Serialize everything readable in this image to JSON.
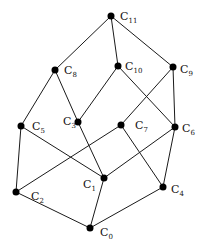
{
  "nodes": [
    {
      "id": "C0",
      "base": "C",
      "sub": "0",
      "x": 90,
      "y": 228,
      "lx": 100,
      "ly": 236
    },
    {
      "id": "C1",
      "base": "C",
      "sub": "1",
      "x": 104,
      "y": 178,
      "lx": 83,
      "ly": 188
    },
    {
      "id": "C2",
      "base": "C",
      "sub": "2",
      "x": 16,
      "y": 192,
      "lx": 31,
      "ly": 200
    },
    {
      "id": "C3",
      "base": "C",
      "sub": "3",
      "x": 78,
      "y": 122,
      "lx": 63,
      "ly": 125
    },
    {
      "id": "C4",
      "base": "C",
      "sub": "4",
      "x": 163,
      "y": 187,
      "lx": 171,
      "ly": 193
    },
    {
      "id": "C5",
      "base": "C",
      "sub": "5",
      "x": 21,
      "y": 126,
      "lx": 32,
      "ly": 130
    },
    {
      "id": "C6",
      "base": "C",
      "sub": "6",
      "x": 175,
      "y": 127,
      "lx": 182,
      "ly": 132
    },
    {
      "id": "C7",
      "base": "C",
      "sub": "7",
      "x": 121,
      "y": 125,
      "lx": 135,
      "ly": 129
    },
    {
      "id": "C8",
      "base": "C",
      "sub": "8",
      "x": 55,
      "y": 70,
      "lx": 64,
      "ly": 74
    },
    {
      "id": "C9",
      "base": "C",
      "sub": "9",
      "x": 173,
      "y": 67,
      "lx": 180,
      "ly": 73
    },
    {
      "id": "C10",
      "base": "C",
      "sub": "10",
      "x": 118,
      "y": 66,
      "lx": 125,
      "ly": 70
    },
    {
      "id": "C11",
      "base": "C",
      "sub": "11",
      "x": 111,
      "y": 16,
      "lx": 120,
      "ly": 20
    }
  ],
  "edges": [
    [
      "C11",
      "C8"
    ],
    [
      "C11",
      "C10"
    ],
    [
      "C11",
      "C9"
    ],
    [
      "C8",
      "C5"
    ],
    [
      "C8",
      "C3"
    ],
    [
      "C10",
      "C3"
    ],
    [
      "C10",
      "C6"
    ],
    [
      "C9",
      "C7"
    ],
    [
      "C9",
      "C6"
    ],
    [
      "C5",
      "C2"
    ],
    [
      "C5",
      "C1"
    ],
    [
      "C3",
      "C1"
    ],
    [
      "C7",
      "C2"
    ],
    [
      "C7",
      "C4"
    ],
    [
      "C6",
      "C1"
    ],
    [
      "C6",
      "C4"
    ],
    [
      "C2",
      "C0"
    ],
    [
      "C1",
      "C0"
    ],
    [
      "C4",
      "C0"
    ]
  ],
  "style": {
    "edge_color": "#1a1a1a",
    "node_color": "#000000",
    "node_radius": 3.5
  }
}
